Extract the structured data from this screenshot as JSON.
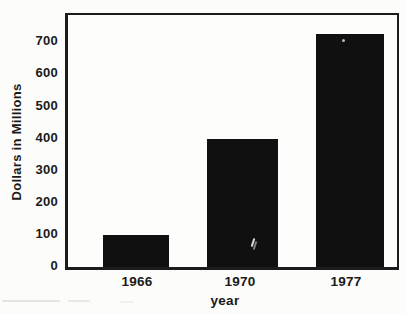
{
  "chart_data": {
    "type": "bar",
    "title": "",
    "categories": [
      "1966",
      "1970",
      "1977"
    ],
    "values": [
      100,
      400,
      725
    ],
    "xlabel": "year",
    "ylabel": "Dollars in Millions",
    "ylim": [
      0,
      780
    ],
    "yticks": [
      0,
      100,
      200,
      300,
      400,
      500,
      600,
      700
    ],
    "grid": false,
    "legend": "none",
    "bar_color": "#101010",
    "frame": "full-box",
    "background_color": "#fcfcfb"
  }
}
